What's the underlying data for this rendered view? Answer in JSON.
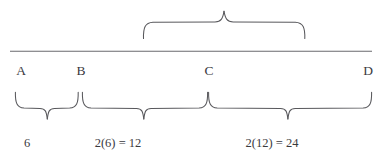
{
  "figure": {
    "type": "number-line-brace-diagram",
    "background_color": "#ffffff",
    "stroke_color": "#58585c",
    "text_color": "#3a3a3e",
    "axis": {
      "name": "horizontal-number-line",
      "x_start": 10,
      "x_end": 372,
      "y": 51
    },
    "point_labels": [
      {
        "text": "A",
        "x": 21,
        "y": 64
      },
      {
        "text": "B",
        "x": 81,
        "y": 64
      },
      {
        "text": "C",
        "x": 209,
        "y": 64
      },
      {
        "text": "D",
        "x": 368,
        "y": 64
      }
    ],
    "top_brace": {
      "name": "brace-b-to-d",
      "x_start": 143,
      "x_end": 305,
      "tip_x": 224,
      "tip_y": 11,
      "body_y": 22,
      "end_y": 38,
      "label": ""
    },
    "bottom_braces": [
      {
        "name": "brace-a-to-b",
        "x_start": 15,
        "x_end": 78,
        "tip_x": 47,
        "tip_y": 119,
        "body_y": 108,
        "end_y": 92,
        "label": "6",
        "label_x": 27,
        "label_y": 137
      },
      {
        "name": "brace-b-to-c",
        "x_start": 82,
        "x_end": 208,
        "tip_x": 144,
        "tip_y": 119,
        "body_y": 108,
        "end_y": 92,
        "label": "2(6) = 12",
        "label_x": 118,
        "label_y": 137
      },
      {
        "name": "brace-c-to-d",
        "x_start": 208,
        "x_end": 372,
        "tip_x": 288,
        "tip_y": 119,
        "body_y": 108,
        "end_y": 92,
        "label": "2(12) = 24",
        "label_x": 272,
        "label_y": 137
      }
    ]
  }
}
